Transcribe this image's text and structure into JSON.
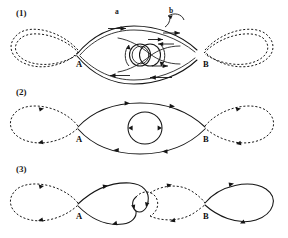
{
  "figure": {
    "background_color": "#ffffff",
    "ink_color": "#151515",
    "width": 288,
    "height": 238
  },
  "panels": [
    {
      "id": "panel-1",
      "label": "(1)",
      "label_x": 18,
      "label_y": 10,
      "nodes": [
        {
          "name": "A",
          "label": "A",
          "x": 78,
          "y": 58
        },
        {
          "name": "B",
          "label": "B",
          "x": 204,
          "y": 58
        }
      ],
      "segment_labels": [
        {
          "name": "a",
          "label": "a",
          "x": 116,
          "y": 9
        },
        {
          "name": "b",
          "label": "b",
          "x": 170,
          "y": 9
        }
      ],
      "description": "Two flux tubes drawn as doubled solid lines meeting at crossing points A and B, with dashed outer loops on both ends and a twisted double-circle core at centre; straight flow arrows along the tubes and curved circulation arrows around the core."
    },
    {
      "id": "panel-2",
      "label": "(2)",
      "label_x": 18,
      "label_y": 89,
      "nodes": [
        {
          "name": "A",
          "label": "A",
          "x": 78,
          "y": 133
        },
        {
          "name": "B",
          "label": "B",
          "x": 204,
          "y": 133
        }
      ],
      "segment_labels": [],
      "description": "Single solid lens between A and B enclosing one circular ring, dashed outer loops on both ends, directional arrowheads on every strand."
    },
    {
      "id": "panel-3",
      "label": "(3)",
      "label_x": 18,
      "label_y": 166,
      "nodes": [
        {
          "name": "A",
          "label": "A",
          "x": 78,
          "y": 210
        },
        {
          "name": "B",
          "label": "B",
          "x": 204,
          "y": 210
        }
      ],
      "segment_labels": [],
      "description": "Reconnected state: solid loop from A folding into a small inner hook, dashed loop from the hook continuing to B, dashed loop at far left and large solid loop at far right."
    }
  ],
  "legend": {
    "solid_line_meaning": "solid strand",
    "dashed_line_meaning": "dashed strand",
    "arrow_meaning": "flow direction"
  }
}
